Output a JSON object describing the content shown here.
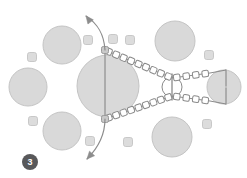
{
  "figure": {
    "title": "",
    "background_color": "#ffffff",
    "width": 247,
    "height": 178
  },
  "palette": {
    "blob_fill": "#d9d9d9",
    "blob_stroke": "#c4c4c4",
    "small_blob_fill": "#dcdcdc",
    "small_blob_stroke": "#c8c8c8",
    "chain_stroke": "#8a8a8a",
    "chain_fill": "#ffffff",
    "node_fill": "#c9c9c9",
    "node_stroke": "#9a9a9a",
    "arrow_stroke": "#8c8c8c",
    "rod_stroke": "#a0a0a0",
    "badge_fill": "#58585a",
    "badge_text": "#ffffff"
  },
  "step_badge": {
    "label": "3",
    "cx": 30,
    "cy": 162,
    "r": 8,
    "font_size": 9
  },
  "large_blobs": [
    {
      "name": "central-large-vesicle",
      "cx": 108,
      "cy": 86,
      "r": 31
    },
    {
      "name": "upper-left-vesicle",
      "cx": 62,
      "cy": 45,
      "r": 19
    },
    {
      "name": "left-vesicle",
      "cx": 28,
      "cy": 87,
      "r": 19
    },
    {
      "name": "lower-left-vesicle",
      "cx": 62,
      "cy": 131,
      "r": 19
    },
    {
      "name": "upper-right-vesicle",
      "cx": 175,
      "cy": 41,
      "r": 20
    },
    {
      "name": "lower-right-vesicle",
      "cx": 172,
      "cy": 137,
      "r": 20
    },
    {
      "name": "far-right-vesicle",
      "cx": 224,
      "cy": 87,
      "r": 17
    }
  ],
  "small_blobs": [
    {
      "name": "small-particle",
      "cx": 88,
      "cy": 40,
      "r": 4.5
    },
    {
      "name": "small-particle",
      "cx": 113,
      "cy": 39,
      "r": 4.5
    },
    {
      "name": "small-particle",
      "cx": 130,
      "cy": 40,
      "r": 4.5
    },
    {
      "name": "small-particle",
      "cx": 32,
      "cy": 57,
      "r": 4.5
    },
    {
      "name": "small-particle",
      "cx": 209,
      "cy": 55,
      "r": 4.5
    },
    {
      "name": "small-particle",
      "cx": 33,
      "cy": 121,
      "r": 4.5
    },
    {
      "name": "small-particle",
      "cx": 90,
      "cy": 141,
      "r": 4.5
    },
    {
      "name": "small-particle",
      "cx": 128,
      "cy": 142,
      "r": 4.5
    },
    {
      "name": "small-particle",
      "cx": 207,
      "cy": 124,
      "r": 4.5
    }
  ],
  "junction_nodes": [
    {
      "name": "upper-junction-node",
      "cx": 105,
      "cy": 50,
      "size": 7
    },
    {
      "name": "lower-junction-node",
      "cx": 105,
      "cy": 119,
      "size": 7
    }
  ],
  "rods": [
    {
      "name": "central-axis-rod",
      "x1": 105,
      "y1": 50,
      "x2": 105,
      "y2": 119
    },
    {
      "name": "hub-axis-rod",
      "x1": 172,
      "y1": 74,
      "x2": 172,
      "y2": 100
    },
    {
      "name": "far-right-rod-top",
      "x1": 226,
      "y1": 70,
      "x2": 226,
      "y2": 86
    },
    {
      "name": "far-right-rod-bot",
      "x1": 226,
      "y1": 88,
      "x2": 226,
      "y2": 104
    }
  ],
  "hub_circle": {
    "name": "right-hub-circle",
    "cx": 172,
    "cy": 87,
    "r": 10
  },
  "chains": [
    {
      "name": "upper-filament-chain",
      "path": "M105,50 L172,78",
      "bead_count": 9
    },
    {
      "name": "lower-filament-chain",
      "path": "M105,119 L172,96",
      "bead_count": 9
    },
    {
      "name": "upper-right-return-chain",
      "path": "M172,78 L210,73",
      "bead_count": 4
    },
    {
      "name": "lower-right-return-chain",
      "path": "M172,96 L210,101",
      "bead_count": 4
    }
  ],
  "connector_lines": [
    {
      "name": "upper-right-connector",
      "path": "M210,73 L226,70"
    },
    {
      "name": "lower-right-connector",
      "path": "M210,101 L226,104"
    }
  ],
  "arrows": [
    {
      "name": "outward-arrow-up-left",
      "path": "M105,50 C104,34 98,24 86,16",
      "head_at": [
        86,
        16
      ],
      "head_angle": -128,
      "direction": "up-left"
    },
    {
      "name": "outward-arrow-down-left",
      "path": "M105,119 C105,136 98,148 87,159",
      "head_at": [
        87,
        159
      ],
      "head_angle": 132,
      "direction": "down-left"
    }
  ]
}
